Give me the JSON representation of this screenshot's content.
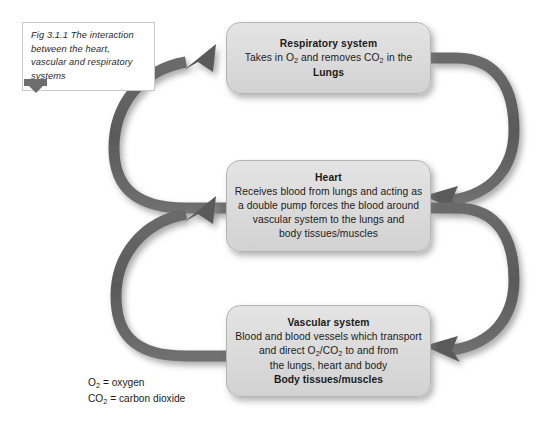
{
  "figure": {
    "caption": "Fig 3.1.1 The interaction between the heart, vascular and respiratory systems",
    "marker_icon": "bookmark-flag-icon"
  },
  "diagram": {
    "type": "cycle-flow-diagram",
    "nodes": [
      {
        "id": "respiratory",
        "title": "Respiratory system",
        "lines": [
          {
            "text": "Takes in O2 and removes CO2 in the",
            "bold": false
          },
          {
            "text": "Lungs",
            "bold": true
          }
        ]
      },
      {
        "id": "heart",
        "title": "Heart",
        "lines": [
          {
            "text": "Receives blood from lungs and acting as",
            "bold": false
          },
          {
            "text": "a double pump forces the blood around",
            "bold": false
          },
          {
            "text": "vascular system to the lungs and",
            "bold": false
          },
          {
            "text": "body tissues/muscles",
            "bold": false
          }
        ]
      },
      {
        "id": "vascular",
        "title": "Vascular system",
        "lines": [
          {
            "text": "Blood and blood vessels which transport",
            "bold": false
          },
          {
            "text": "and direct O2/CO2 to and from",
            "bold": false
          },
          {
            "text": "the lungs, heart and body",
            "bold": false
          },
          {
            "text": "Body tissues/muscles",
            "bold": true
          }
        ]
      }
    ],
    "arrows": [
      {
        "id": "heart-to-respiratory",
        "from": "heart",
        "to": "respiratory",
        "side": "left",
        "direction": "up"
      },
      {
        "id": "respiratory-to-heart",
        "from": "respiratory",
        "to": "heart",
        "side": "right",
        "direction": "down"
      },
      {
        "id": "vascular-to-heart",
        "from": "vascular",
        "to": "heart",
        "side": "left",
        "direction": "up"
      },
      {
        "id": "heart-to-vascular",
        "from": "heart",
        "to": "vascular",
        "side": "right",
        "direction": "down"
      }
    ],
    "arrow_color": "#5f5f5f",
    "box_fill_color": "#dcdcdc",
    "box_border_color": "#b4b4b4"
  },
  "legend": {
    "lines": [
      {
        "symbol": "O2",
        "equals": " = oxygen"
      },
      {
        "symbol": "CO2",
        "equals": " = carbon dioxide"
      }
    ]
  }
}
